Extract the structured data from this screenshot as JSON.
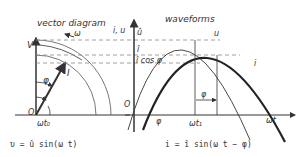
{
  "vector_diagram": {
    "title": "vector diagram",
    "omega_label": "ω",
    "v_axis_label": "V",
    "i_label": "I",
    "phi_label": "φ",
    "origin_label": "O",
    "angle_label": "ωt₀"
  },
  "waveforms": {
    "title": "waveforms",
    "y_axis_label": "i, u",
    "u_hat_label": "û",
    "i_hat_label": "î",
    "i_cos_label": "î cos φ",
    "u_curve_label": "u",
    "i_curve_label": "i",
    "origin_label": "O",
    "phi_bottom_label": "φ",
    "phi_shift_label": "φ",
    "t1_label": "ωt₁",
    "x_axis_label": "ωt"
  },
  "equations": {
    "voltage": "υ  =  û sin(ω t)",
    "current": "i  =  î sin(ω t − φ)"
  },
  "colors": {
    "line": "#333333",
    "dashed": "#888888",
    "background": "#ffffff"
  }
}
